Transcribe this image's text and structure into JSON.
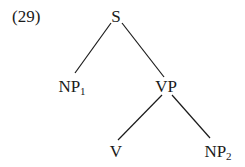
{
  "example_label": "(29)",
  "tree": {
    "nodes": {
      "S": {
        "label": "S",
        "sub": ""
      },
      "NP1": {
        "label": "NP",
        "sub": "1"
      },
      "VP": {
        "label": "VP",
        "sub": ""
      },
      "V": {
        "label": "V",
        "sub": ""
      },
      "NP2": {
        "label": "NP",
        "sub": "2"
      }
    },
    "edges": [
      [
        "S",
        "NP1"
      ],
      [
        "S",
        "VP"
      ],
      [
        "VP",
        "V"
      ],
      [
        "VP",
        "NP2"
      ]
    ]
  },
  "colors": {
    "ink": "#1a1a1a",
    "background": "#ffffff"
  }
}
